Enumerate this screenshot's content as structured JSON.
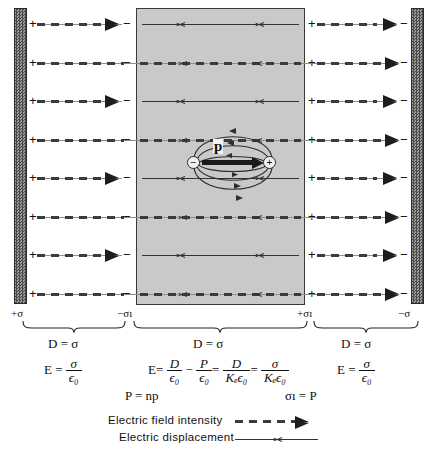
{
  "figure": {
    "plates": {
      "left_sign": "+",
      "right_sign": "−",
      "row_count": 8
    },
    "slab": {
      "label": "dielectric",
      "left_boundary_sign": "−",
      "right_boundary_sign": "+"
    },
    "dipole": {
      "negative_charge": "−",
      "positive_charge": "+",
      "moment_label": "p"
    },
    "surface_charges": [
      {
        "name": "left-plate-charge",
        "text": "+σ"
      },
      {
        "name": "slab-left-charge",
        "text": "−σı"
      },
      {
        "name": "slab-right-charge",
        "text": "+σı"
      },
      {
        "name": "right-plate-charge",
        "text": "−σ"
      }
    ],
    "regions": [
      {
        "name": "left-gap",
        "displacement": "D = σ",
        "field_numerator": "σ",
        "field_denominator": "ϵ₀",
        "field_lead": "E ="
      },
      {
        "name": "dielectric",
        "displacement": "D = σ",
        "field_expression": "E = D/ϵ₀ − P/ϵ₀ = D/(Kₑϵ₀) = σ/(Kₑϵ₀)"
      },
      {
        "name": "right-gap",
        "displacement": "D = σ",
        "field_numerator": "σ",
        "field_denominator": "ϵ₀",
        "field_lead": "E ="
      }
    ],
    "aux_equations": [
      {
        "name": "polarization-definition",
        "text": "P = np"
      },
      {
        "name": "bound-charge-relation",
        "text": "σı = P"
      }
    ],
    "legend": [
      {
        "name": "legend-e-field",
        "label": "Electric field intensity",
        "style": "dashed-arrow"
      },
      {
        "name": "legend-displacement",
        "label": "Electric displacement",
        "style": "solid-arrow"
      }
    ],
    "symbols": {
      "E": "E",
      "D": "D",
      "P": "P",
      "sigma": "σ",
      "sigma_prime": "σı",
      "epsilon0": "ϵ₀",
      "Ke": "Kₑ",
      "equals": "=",
      "minus": "−",
      "n": "n",
      "p": "p"
    }
  }
}
